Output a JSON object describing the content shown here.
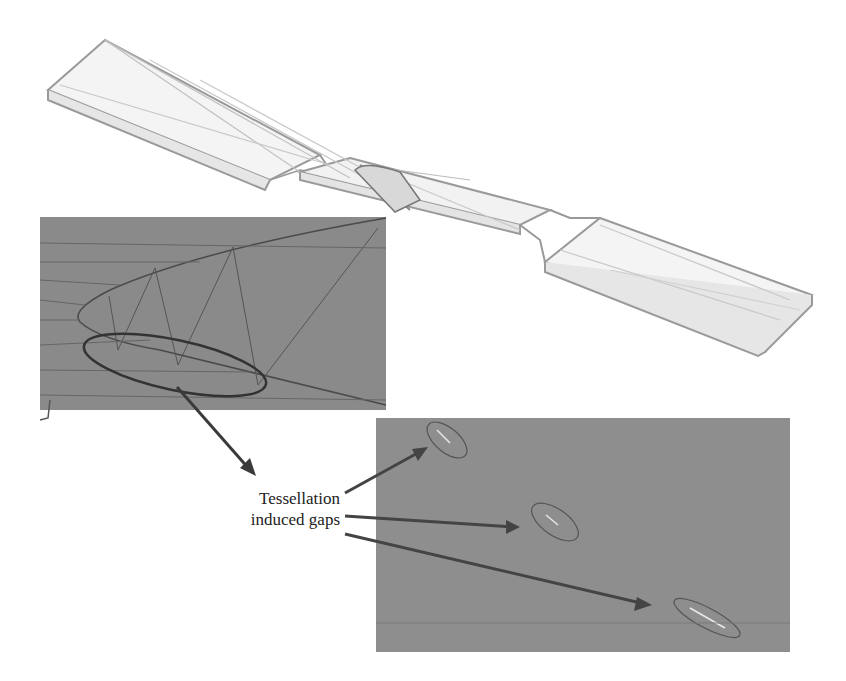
{
  "figure": {
    "annotation": {
      "line1": "Tessellation",
      "line2": "induced gaps"
    },
    "colors": {
      "background": "#ffffff",
      "panel_fill": "#8a8a8a",
      "wireframe": "#9a9a9a",
      "arrow": "#4a4a4a",
      "ellipse": "#3c3c3c"
    },
    "elements": {
      "specimen": "3D wireframe dog-bone tensile specimen",
      "inset_left": "zoomed tessellation mesh detail with highlighted region",
      "inset_right": "zoomed surface showing three gaps",
      "gap_count": 3
    }
  }
}
